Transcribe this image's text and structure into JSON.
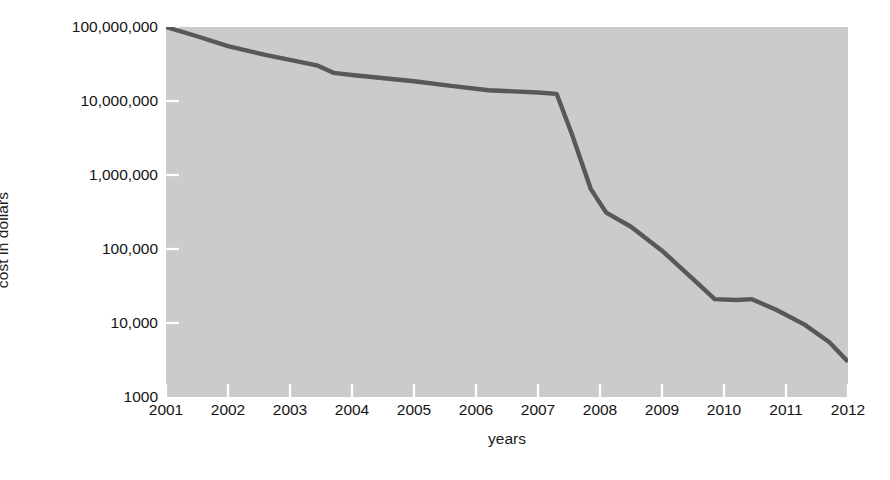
{
  "chart_data": {
    "type": "line",
    "title": "",
    "xlabel": "years",
    "ylabel": "cost in dollars",
    "yscale": "log",
    "ylim": [
      1000,
      100000000
    ],
    "xlim": [
      2001,
      2012
    ],
    "grid": false,
    "legend": null,
    "line_color": "#585858",
    "plot_background": "#cbcbcb",
    "page_background": "#ffffff",
    "text_color": "#141414",
    "ytick_labels": [
      "100,000,000",
      "10,000,000",
      "1,000,000",
      "100,000",
      "10,000",
      "1000"
    ],
    "ytick_values": [
      100000000,
      10000000,
      1000000,
      100000,
      10000,
      1000
    ],
    "xtick_labels": [
      "2001",
      "2002",
      "2003",
      "2004",
      "2005",
      "2006",
      "2007",
      "2008",
      "2009",
      "2010",
      "2011",
      "2012"
    ],
    "xtick_values": [
      2001,
      2002,
      2003,
      2004,
      2005,
      2006,
      2007,
      2008,
      2009,
      2010,
      2011,
      2012
    ],
    "series": [
      {
        "name": "cost",
        "x": [
          2001.0,
          2001.5,
          2002.0,
          2002.6,
          2003.0,
          2003.45,
          2003.7,
          2004.0,
          2004.6,
          2005.0,
          2005.6,
          2006.2,
          2007.0,
          2007.3,
          2007.55,
          2007.85,
          2008.1,
          2008.5,
          2009.0,
          2009.55,
          2009.85,
          2010.2,
          2010.45,
          2010.85,
          2011.3,
          2011.7,
          2012.0
        ],
        "y": [
          100000000,
          75000000,
          55000000,
          42000000,
          36000000,
          30000000,
          24000000,
          22500000,
          20000000,
          18500000,
          16000000,
          14000000,
          13000000,
          12500000,
          3500000,
          650000,
          310000,
          200000,
          95000,
          36000,
          21000,
          20500,
          21000,
          15000,
          9500,
          5500,
          3000
        ]
      }
    ]
  }
}
